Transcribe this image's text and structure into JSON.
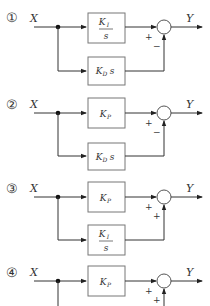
{
  "diagrams": [
    {
      "number": "①",
      "input": "X",
      "output": "Y",
      "top_block": {
        "num": "K",
        "num_sub": "I",
        "den": "s",
        "type": "fraction"
      },
      "bottom_block": {
        "main": "K",
        "sub": "D",
        "suffix": "s",
        "type": "inline"
      },
      "sign_top": "+",
      "sign_bottom": "−"
    },
    {
      "number": "②",
      "input": "X",
      "output": "Y",
      "top_block": {
        "main": "K",
        "sub": "P",
        "suffix": "",
        "type": "inline"
      },
      "bottom_block": {
        "main": "K",
        "sub": "D",
        "suffix": "s",
        "type": "inline"
      },
      "sign_top": "+",
      "sign_bottom": "−"
    },
    {
      "number": "③",
      "input": "X",
      "output": "Y",
      "top_block": {
        "main": "K",
        "sub": "P",
        "suffix": "",
        "type": "inline"
      },
      "bottom_block": {
        "num": "K",
        "num_sub": "I",
        "den": "s",
        "type": "fraction"
      },
      "sign_top": "+",
      "sign_bottom": "+"
    },
    {
      "number": "④",
      "input": "X",
      "output": "Y",
      "top_block": {
        "main": "K",
        "sub": "P",
        "suffix": "",
        "type": "inline"
      },
      "sign_top": "+",
      "sign_bottom": "+"
    }
  ]
}
